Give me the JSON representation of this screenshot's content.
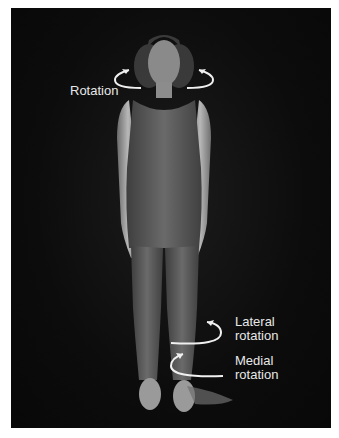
{
  "figure": {
    "background_color": "#0a0a0a",
    "labels": {
      "head_rotation": "Rotation",
      "lateral_line1": "Lateral",
      "lateral_line2": "rotation",
      "medial_line1": "Medial",
      "medial_line2": "rotation"
    },
    "arrows": [
      {
        "name": "head-rotation-left-arrow",
        "region": "neck-left"
      },
      {
        "name": "head-rotation-right-arrow",
        "region": "neck-right"
      },
      {
        "name": "lateral-rotation-arrow",
        "region": "lower-leg"
      },
      {
        "name": "medial-rotation-arrow",
        "region": "lower-leg"
      }
    ]
  }
}
